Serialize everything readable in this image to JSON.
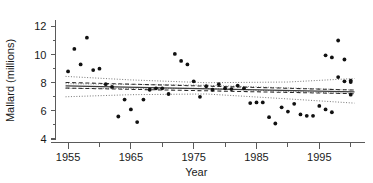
{
  "chart_data": {
    "type": "scatter",
    "title": "",
    "xlabel": "Year",
    "ylabel": "Mallard (millions)",
    "xlim": [
      1953,
      2001
    ],
    "ylim": [
      4,
      12.6
    ],
    "grid": false,
    "legend": null,
    "x_ticks_major": [
      1955,
      1965,
      1975,
      1985,
      1995
    ],
    "x_ticks_major_labels": [
      "1955",
      "1965",
      "1975",
      "1985",
      "1995"
    ],
    "x_ticks_minor": [
      1960,
      1970,
      1980,
      1990,
      2000
    ],
    "y_ticks_major": [
      4,
      6,
      8,
      10,
      12
    ],
    "y_ticks_major_labels": [
      "4",
      "6",
      "8",
      "10",
      "12"
    ],
    "y_ticks_minor": [
      5,
      7,
      9,
      11
    ],
    "series": [
      {
        "name": "Mallard population",
        "marker": "filled-circle",
        "color": "#111111",
        "x": [
          1955,
          1956,
          1957,
          1958,
          1959,
          1960,
          1961,
          1962,
          1963,
          1964,
          1965,
          1966,
          1967,
          1968,
          1969,
          1970,
          1971,
          1972,
          1973,
          1974,
          1975,
          1976,
          1977,
          1978,
          1979,
          1980,
          1981,
          1982,
          1983,
          1984,
          1985,
          1986,
          1987,
          1988,
          1989,
          1990,
          1991,
          1992,
          1993,
          1994,
          1995,
          1996,
          1997,
          1998,
          1999,
          2000
        ],
        "y": [
          8.8,
          10.4,
          9.3,
          11.2,
          8.9,
          9.0,
          7.9,
          7.7,
          5.6,
          6.8,
          6.1,
          5.2,
          6.8,
          7.5,
          7.6,
          7.6,
          7.2,
          10.05,
          9.55,
          9.3,
          8.1,
          7.0,
          7.75,
          7.5,
          7.9,
          7.6,
          7.55,
          7.8,
          7.6,
          6.55,
          6.6,
          6.6,
          5.55,
          5.1,
          6.25,
          5.95,
          6.5,
          5.75,
          5.65,
          5.65,
          6.35,
          6.1,
          5.9,
          8.4,
          8.1,
          7.15
        ],
        "x_extra": [
          1996,
          1997,
          1998,
          1999,
          2000
        ],
        "y_extra": [
          9.95,
          9.8,
          11.0,
          9.65,
          8.05
        ],
        "x_tail": [
          2000
        ],
        "y_tail": [
          8.15
        ]
      }
    ],
    "fit_lines": [
      {
        "name": "regression-solid",
        "style": "solid",
        "x": [
          1954.6,
          2000.6
        ],
        "y": [
          7.78,
          7.35
        ]
      },
      {
        "name": "regression-dashed-upper",
        "style": "dashed",
        "x": [
          1954.6,
          2000.6
        ],
        "y": [
          8.02,
          7.48
        ]
      },
      {
        "name": "regression-dashed-lower",
        "style": "dashed",
        "x": [
          1954.6,
          2000.6
        ],
        "y": [
          7.62,
          7.22
        ]
      }
    ],
    "confidence_bands": [
      {
        "name": "outer-band-upper",
        "style": "dotted",
        "x": [
          1954.6,
          1965,
          1977,
          1990,
          2000.6
        ],
        "y": [
          8.45,
          8.2,
          8.0,
          8.05,
          8.3
        ]
      },
      {
        "name": "outer-band-lower",
        "style": "dotted",
        "x": [
          1954.6,
          1965,
          1977,
          1990,
          2000.6
        ],
        "y": [
          7.0,
          7.15,
          7.2,
          6.85,
          6.55
        ]
      },
      {
        "name": "inner-band-upper",
        "style": "dotted",
        "x": [
          1954.6,
          1977,
          2000.6
        ],
        "y": [
          7.93,
          7.82,
          7.48
        ]
      },
      {
        "name": "inner-band-lower",
        "style": "dotted",
        "x": [
          1954.6,
          1977,
          2000.6
        ],
        "y": [
          7.6,
          7.6,
          7.22
        ]
      }
    ]
  },
  "labels": {
    "x_axis_title": "Year",
    "y_axis_title": "Mallard (millions)"
  }
}
